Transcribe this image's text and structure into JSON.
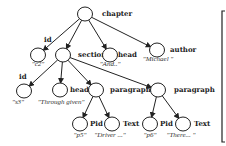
{
  "diagram": {
    "nodes": [
      {
        "id": "chapter",
        "label": "chapter",
        "value": "",
        "cx": 85,
        "cy": 14,
        "lx": 102,
        "ly": 16
      },
      {
        "id": "id1",
        "label": "id",
        "value": "\"c2\"",
        "cx": 38,
        "cy": 55,
        "lx": 44,
        "ly": 42,
        "vx": 38,
        "vy": 66
      },
      {
        "id": "section",
        "label": "section",
        "value": "",
        "cx": 63,
        "cy": 55,
        "lx": 78,
        "ly": 57
      },
      {
        "id": "head1",
        "label": "head",
        "value": "\"And..\"",
        "cx": 110,
        "cy": 55,
        "lx": 118,
        "ly": 57,
        "vx": 110,
        "vy": 66
      },
      {
        "id": "author",
        "label": "author",
        "value": "\"Michael \"",
        "cx": 157,
        "cy": 50,
        "lx": 170,
        "ly": 52,
        "vx": 158,
        "vy": 61
      },
      {
        "id": "id2",
        "label": "id",
        "value": "\"s3\"",
        "cx": 24,
        "cy": 91,
        "lx": 19,
        "ly": 79,
        "vx": 18,
        "vy": 104
      },
      {
        "id": "head2",
        "label": "head",
        "value": "\"Through given\"",
        "cx": 60,
        "cy": 90,
        "lx": 70,
        "ly": 92,
        "vx": 61,
        "vy": 104
      },
      {
        "id": "para1",
        "label": "paragraph",
        "value": "",
        "cx": 96,
        "cy": 90,
        "lx": 110,
        "ly": 92
      },
      {
        "id": "para2",
        "label": "paragraph",
        "value": "",
        "cx": 158,
        "cy": 90,
        "lx": 174,
        "ly": 92
      },
      {
        "id": "pid1",
        "label": "Pid",
        "value": "\"p5\"",
        "cx": 80,
        "cy": 124,
        "lx": 90,
        "ly": 126,
        "vx": 80,
        "vy": 137
      },
      {
        "id": "text1",
        "label": "Text",
        "value": "\"Driver ...\"",
        "cx": 112,
        "cy": 124,
        "lx": 123,
        "ly": 126,
        "vx": 110,
        "vy": 137
      },
      {
        "id": "pid2",
        "label": "Pid",
        "value": "\"p6\"",
        "cx": 150,
        "cy": 124,
        "lx": 160,
        "ly": 126,
        "vx": 150,
        "vy": 137
      },
      {
        "id": "text2",
        "label": "Text",
        "value": "\"There... \"",
        "cx": 183,
        "cy": 124,
        "lx": 194,
        "ly": 126,
        "vx": 181,
        "vy": 137
      }
    ],
    "edges": [
      [
        "chapter",
        "id1"
      ],
      [
        "chapter",
        "section"
      ],
      [
        "chapter",
        "head1"
      ],
      [
        "chapter",
        "author"
      ],
      [
        "section",
        "id2"
      ],
      [
        "section",
        "head2"
      ],
      [
        "section",
        "para1"
      ],
      [
        "section",
        "para2"
      ],
      [
        "para1",
        "pid1"
      ],
      [
        "para1",
        "text1"
      ],
      [
        "para2",
        "pid2"
      ],
      [
        "para2",
        "text2"
      ]
    ],
    "radius": 7,
    "colors": {
      "stroke": "#222222",
      "background": "#ffffff"
    }
  }
}
